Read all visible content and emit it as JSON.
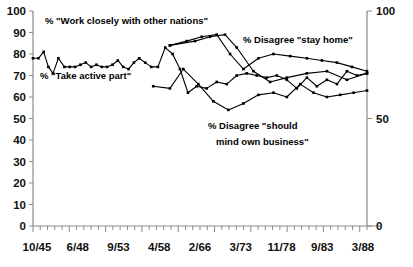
{
  "chart_data": {
    "type": "line",
    "title": "",
    "xlabel": "",
    "ylabel": "",
    "ylim": [
      0,
      100
    ],
    "grid": false,
    "legend_position": "inline-annotations",
    "y_ticks_left": [
      0,
      10,
      20,
      30,
      40,
      50,
      60,
      70,
      80,
      90,
      100
    ],
    "y_ticks_right": [
      0,
      50,
      100
    ],
    "x_tick_labels": [
      "10/45",
      "6/48",
      "9/53",
      "4/58",
      "2/66",
      "3/73",
      "11/78",
      "9/83",
      "3/88"
    ],
    "series": [
      {
        "name": "% \"Take active part\"",
        "x": [
          0.0,
          1.6,
          3.2,
          4.6,
          6.0,
          7.6,
          9.4,
          11.0,
          12.6,
          14.2,
          15.8,
          17.4,
          19.0,
          20.6,
          22.2,
          23.8,
          25.4,
          27.0,
          28.6,
          30.2,
          31.8,
          33.6,
          35.4,
          37.4,
          39.6,
          41.8,
          44.0,
          46.4,
          49.0,
          52.0,
          55.0,
          58.0,
          61.0,
          64.0,
          67.0,
          70.0,
          73.0,
          76.0,
          79.0,
          82.0,
          85.0,
          88.0,
          91.0,
          94.0,
          97.0,
          100.0
        ],
        "values": [
          78,
          78,
          81,
          74,
          71,
          78,
          74,
          74,
          74,
          75,
          76,
          74,
          75,
          74,
          74,
          75,
          77,
          74,
          73,
          76,
          78,
          76,
          74,
          74,
          83,
          80,
          73,
          62,
          65,
          64,
          67,
          66,
          70,
          71,
          70,
          69,
          70,
          68,
          64,
          69,
          65,
          68,
          66,
          72,
          70,
          71
        ]
      },
      {
        "name": "% \"Work closely with other nations\"",
        "x": [
          41.0,
          48.5,
          53.0,
          57.5,
          61.0,
          66.0,
          71.0,
          76.0,
          82.0,
          88.0,
          94.0,
          100.0
        ],
        "values": [
          84,
          86,
          88,
          89,
          83,
          72,
          67,
          69,
          71,
          72,
          68,
          71
        ]
      },
      {
        "name": "% Disagree \"stay home\"",
        "x": [
          41.0,
          46.0,
          50.5,
          55.0,
          59.0,
          63.0,
          67.5,
          72.0,
          77.0,
          82.0,
          86.5,
          91.0,
          95.5,
          100.0
        ],
        "values": [
          84,
          86,
          88,
          89,
          80,
          73,
          78,
          80,
          79,
          78,
          77,
          76,
          74,
          72
        ]
      },
      {
        "name": "% Disagree \"should mind own business\"",
        "x": [
          36.0,
          41.0,
          45.0,
          49.5,
          54.0,
          58.5,
          63.0,
          67.5,
          72.0,
          76.0,
          80.0,
          84.0,
          88.0,
          92.0,
          96.0,
          100.0
        ],
        "values": [
          65,
          64,
          73,
          66,
          58,
          54,
          57,
          61,
          62,
          60,
          66,
          62,
          60,
          61,
          62,
          63
        ]
      }
    ],
    "annotations": [
      {
        "id": "annot-work-closely",
        "text": "% \"Work closely with other nations\""
      },
      {
        "id": "annot-take-active-part",
        "text": "% \"Take active part\""
      },
      {
        "id": "annot-disagree-stay-home",
        "text": "% Disagree \"stay home\""
      },
      {
        "id": "annot-disagree-mind-own-business-line1",
        "text": "% Disagree \"should"
      },
      {
        "id": "annot-disagree-mind-own-business-line2",
        "text": "mind own business\""
      }
    ],
    "colors": {
      "line": "#000000",
      "axis": "#8a8a8a",
      "background": "#ffffff",
      "text": "#111111"
    }
  }
}
